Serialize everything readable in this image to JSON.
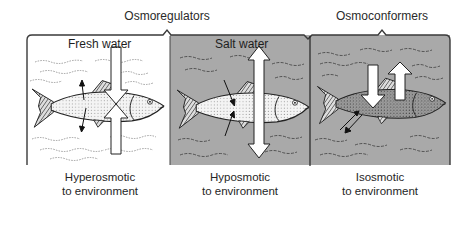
{
  "groups": [
    {
      "id": "osmoregulators",
      "label": "Osmoregulators",
      "center_x": 167
    },
    {
      "id": "osmoconformers",
      "label": "Osmoconformers",
      "center_x": 382
    }
  ],
  "panels": [
    {
      "id": "fresh-water",
      "title": "Fresh water",
      "background": "#ffffff",
      "fish_shading": "light",
      "water_flow": "water in, ions out (small arrows); large arrows pointing toward fish body from top and bottom",
      "caption_line1": "Hyperosmotic",
      "caption_line2": "to environment"
    },
    {
      "id": "salt-water",
      "title": "Salt water",
      "background": "#a9a9a9",
      "fish_shading": "light",
      "water_flow": "double-headed vertical arrow (water leaves fish)",
      "caption_line1": "Hyposmotic",
      "caption_line2": "to environment"
    },
    {
      "id": "osmoconformer",
      "title": "",
      "background": "#a9a9a9",
      "fish_shading": "dark",
      "water_flow": "one arrow down, one arrow up (balanced)",
      "caption_line1": "Isosmotic",
      "caption_line2": "to environment"
    }
  ],
  "colors": {
    "salt_panel": "#a9a9a9",
    "border": "#3a3a3a",
    "arrow_fill": "#ffffff",
    "text": "#222222"
  }
}
